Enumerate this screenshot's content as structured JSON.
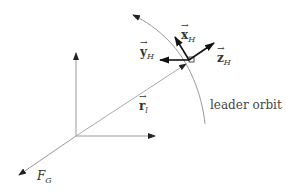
{
  "diagram": {
    "labels": {
      "x_hill": {
        "base": "x",
        "sub": "H"
      },
      "y_hill": {
        "base": "y",
        "sub": "H"
      },
      "z_hill": {
        "base": "z",
        "sub": "H"
      },
      "r_leader": {
        "base": "r",
        "sub": "l"
      },
      "frame_inertial": {
        "base": "F",
        "sub": "G"
      },
      "orbit": "leader orbit"
    },
    "colors": {
      "line": "#9a9a9a",
      "arrow_dark": "#111111",
      "text": "#333333"
    }
  }
}
